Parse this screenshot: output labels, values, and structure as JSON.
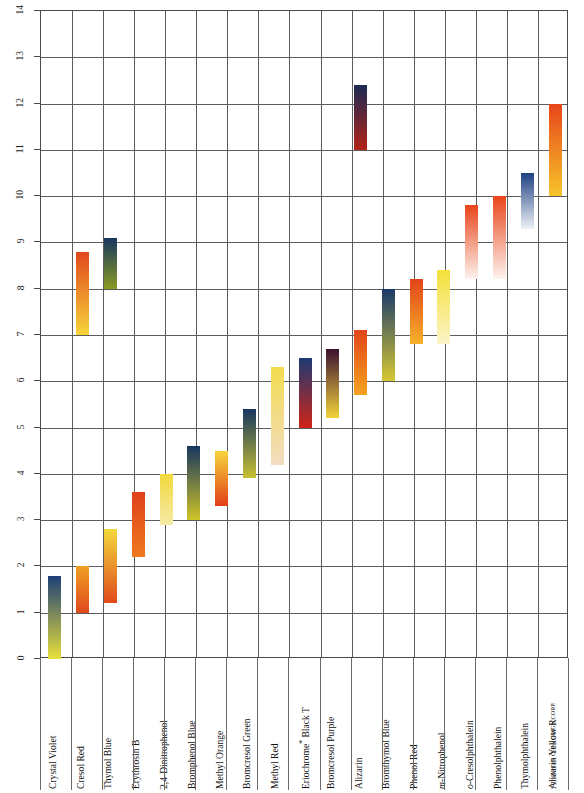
{
  "chart_data": {
    "type": "bar",
    "xlabel": "",
    "ylabel": "pH",
    "ylim": [
      0,
      14
    ],
    "ytick_step": 1,
    "grid": true,
    "legend": "none",
    "orientation": "vertical-range-bars",
    "yticks": [
      "0",
      "1",
      "2",
      "3",
      "4",
      "5",
      "6",
      "7",
      "8",
      "9",
      "10",
      "11",
      "12",
      "13",
      "14"
    ],
    "categories": [
      "Crystal Violet",
      "Cresol Red",
      "Thymol Blue",
      "Erythrosin B",
      "2,4-Dinitrophenol",
      "Bromphenol Blue",
      "Methyl Orange",
      "Bromcresol Green",
      "Methyl Red",
      "Eriochrome* Black T",
      "Bromcresol Purple",
      "Alizarin",
      "Bromthymol Blue",
      "Phenol Red",
      "m-Nitrophenol",
      "o-Cresolphthalein",
      "Phenolphthalein",
      "Thymolphthalein",
      "Alizarin Yellow R"
    ],
    "series": [
      {
        "name": "Crystal Violet",
        "ranges": [
          {
            "low": 0.0,
            "high": 1.8,
            "color_low": "#e8e03a",
            "color_high": "#1d3f77"
          }
        ]
      },
      {
        "name": "Cresol Red",
        "ranges": [
          {
            "low": 1.0,
            "high": 2.0,
            "color_low": "#e0481c",
            "color_high": "#f0a024"
          },
          {
            "low": 7.0,
            "high": 8.8,
            "color_low": "#f7d43a",
            "color_high": "#e1481d"
          }
        ]
      },
      {
        "name": "Thymol Blue",
        "ranges": [
          {
            "low": 1.2,
            "high": 2.8,
            "color_low": "#e04a1c",
            "color_high": "#f3d93c"
          },
          {
            "low": 8.0,
            "high": 9.1,
            "color_low": "#8a9b22",
            "color_high": "#17375f"
          }
        ]
      },
      {
        "name": "Erythrosin B",
        "ranges": [
          {
            "low": 2.2,
            "high": 3.6,
            "color_low": "#ef7a1e",
            "color_high": "#e0401a"
          }
        ]
      },
      {
        "name": "2,4-Dinitrophenol",
        "ranges": [
          {
            "low": 2.9,
            "high": 4.0,
            "color_low": "#f5eaa8",
            "color_high": "#f3d93c"
          }
        ]
      },
      {
        "name": "Bromphenol Blue",
        "ranges": [
          {
            "low": 3.0,
            "high": 4.6,
            "color_low": "#cfc427",
            "color_high": "#17355f"
          }
        ]
      },
      {
        "name": "Methyl Orange",
        "ranges": [
          {
            "low": 3.3,
            "high": 4.5,
            "color_low": "#e23f19",
            "color_high": "#f7d43a"
          }
        ]
      },
      {
        "name": "Bromcresol Green",
        "ranges": [
          {
            "low": 3.9,
            "high": 5.4,
            "color_low": "#c8c032",
            "color_high": "#17365e"
          }
        ]
      },
      {
        "name": "Methyl Red",
        "ranges": [
          {
            "low": 4.2,
            "high": 6.3,
            "color_low": "#f2dcc0",
            "color_high": "#f3dc4e"
          }
        ]
      },
      {
        "name": "Eriochrome* Black T",
        "ranges": [
          {
            "low": 5.0,
            "high": 6.5,
            "color_low": "#cf2417",
            "color_high": "#1d3a72"
          }
        ]
      },
      {
        "name": "Bromcresol Purple",
        "ranges": [
          {
            "low": 5.2,
            "high": 6.7,
            "color_low": "#f3d33a",
            "color_high": "#3b1030"
          }
        ]
      },
      {
        "name": "Alizarin",
        "ranges": [
          {
            "low": 5.7,
            "high": 7.1,
            "color_low": "#f4a21f",
            "color_high": "#e2451b"
          },
          {
            "low": 11.0,
            "high": 12.4,
            "color_low": "#b32317",
            "color_high": "#1b2a53"
          }
        ]
      },
      {
        "name": "Bromthymol Blue",
        "ranges": [
          {
            "low": 6.0,
            "high": 8.0,
            "color_low": "#d7c832",
            "color_high": "#1a3a6b"
          }
        ]
      },
      {
        "name": "Phenol Red",
        "ranges": [
          {
            "low": 6.8,
            "high": 8.2,
            "color_low": "#f5b12a",
            "color_high": "#e1441a"
          }
        ]
      },
      {
        "name": "m-Nitrophenol",
        "ranges": [
          {
            "low": 6.8,
            "high": 8.4,
            "color_low": "#fbf4c9",
            "color_high": "#f5e038"
          }
        ]
      },
      {
        "name": "o-Cresolphthalein",
        "ranges": [
          {
            "low": 8.2,
            "high": 9.8,
            "color_low": "#fdf3ee",
            "color_high": "#e8451a"
          }
        ]
      },
      {
        "name": "Phenolphthalein",
        "ranges": [
          {
            "low": 8.2,
            "high": 10.0,
            "color_low": "#fdf3ee",
            "color_high": "#e8451a"
          }
        ]
      },
      {
        "name": "Thymolphthalein",
        "ranges": [
          {
            "low": 9.3,
            "high": 10.5,
            "color_low": "#eef2f8",
            "color_high": "#1f4181"
          }
        ]
      },
      {
        "name": "Alizarin Yellow R",
        "ranges": [
          {
            "low": 10.0,
            "high": 12.0,
            "color_low": "#f6c52a",
            "color_high": "#e8451a"
          }
        ]
      }
    ]
  },
  "footnote": "* Trademark CIBA GEIGY CORP."
}
